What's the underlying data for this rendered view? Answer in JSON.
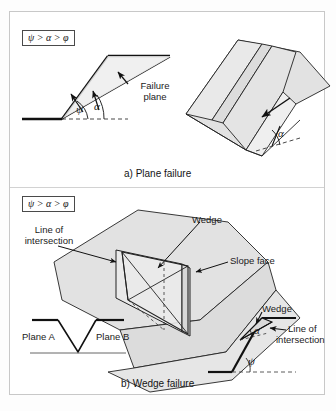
{
  "figure": {
    "domain": "engineering-diagram",
    "panels": [
      {
        "id": "a",
        "caption": "a) Plane failure",
        "condition": "ψ > α > φ",
        "labels": {
          "failure_plane": "Failure\nplane",
          "failure_plane_line1": "Failure",
          "failure_plane_line2": "plane",
          "angle_psi": "ψ",
          "angle_alpha": "α",
          "angle_alpha_3d": "α"
        }
      },
      {
        "id": "b",
        "caption": "b) Wedge failure",
        "condition": "ψ > α > φ",
        "labels": {
          "line_of_intersection_line1": "Line of",
          "line_of_intersection_line2": "intersection",
          "wedge_3d": "Wedge",
          "slope_face": "Slope face",
          "plane_a": "Plane A",
          "plane_b": "Plane B",
          "wedge_section": "Wedge",
          "loi_section_line1": "Line of",
          "loi_section_line2": "intersection",
          "angle_alpha": "α",
          "angle_psi": "ψ"
        }
      }
    ],
    "symbols": {
      "psi": "ψ",
      "alpha": "α",
      "phi": "φ",
      "gt": ">"
    },
    "colors": {
      "ink": "#1a1a1a",
      "rock_fill": "#e2e2e2",
      "rock_fill_dark": "#d2d2d2",
      "rock_fill_light": "#ededed",
      "frame": "#c8c8c8",
      "paper": "#ffffff"
    }
  }
}
